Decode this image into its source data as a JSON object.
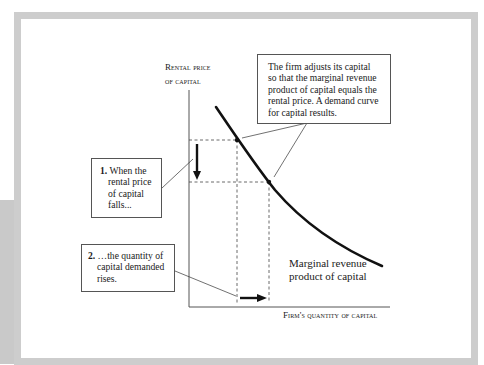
{
  "title": "Demand curve for capital",
  "axes": {
    "y_label_line1": "Rental price",
    "y_label_line2": "of capital",
    "x_label": "Firm's quantity of capital"
  },
  "curve": {
    "label_line1": "Marginal revenue",
    "label_line2": "product of capital"
  },
  "callouts": {
    "top": {
      "lines": [
        "The firm adjusts its capital",
        "so that the marginal revenue",
        "product of capital equals the",
        "rental price. A demand curve",
        "for capital results."
      ]
    },
    "step1": {
      "number": "1.",
      "lines": [
        "When the",
        "rental price",
        "of capital",
        "falls..."
      ]
    },
    "step2": {
      "number": "2.",
      "lines": [
        "…the quantity of",
        "capital demanded",
        "rises."
      ]
    }
  },
  "colors": {
    "frame": "#cdcdcd",
    "ink": "#1a1a1a",
    "dashed": "#444444"
  }
}
